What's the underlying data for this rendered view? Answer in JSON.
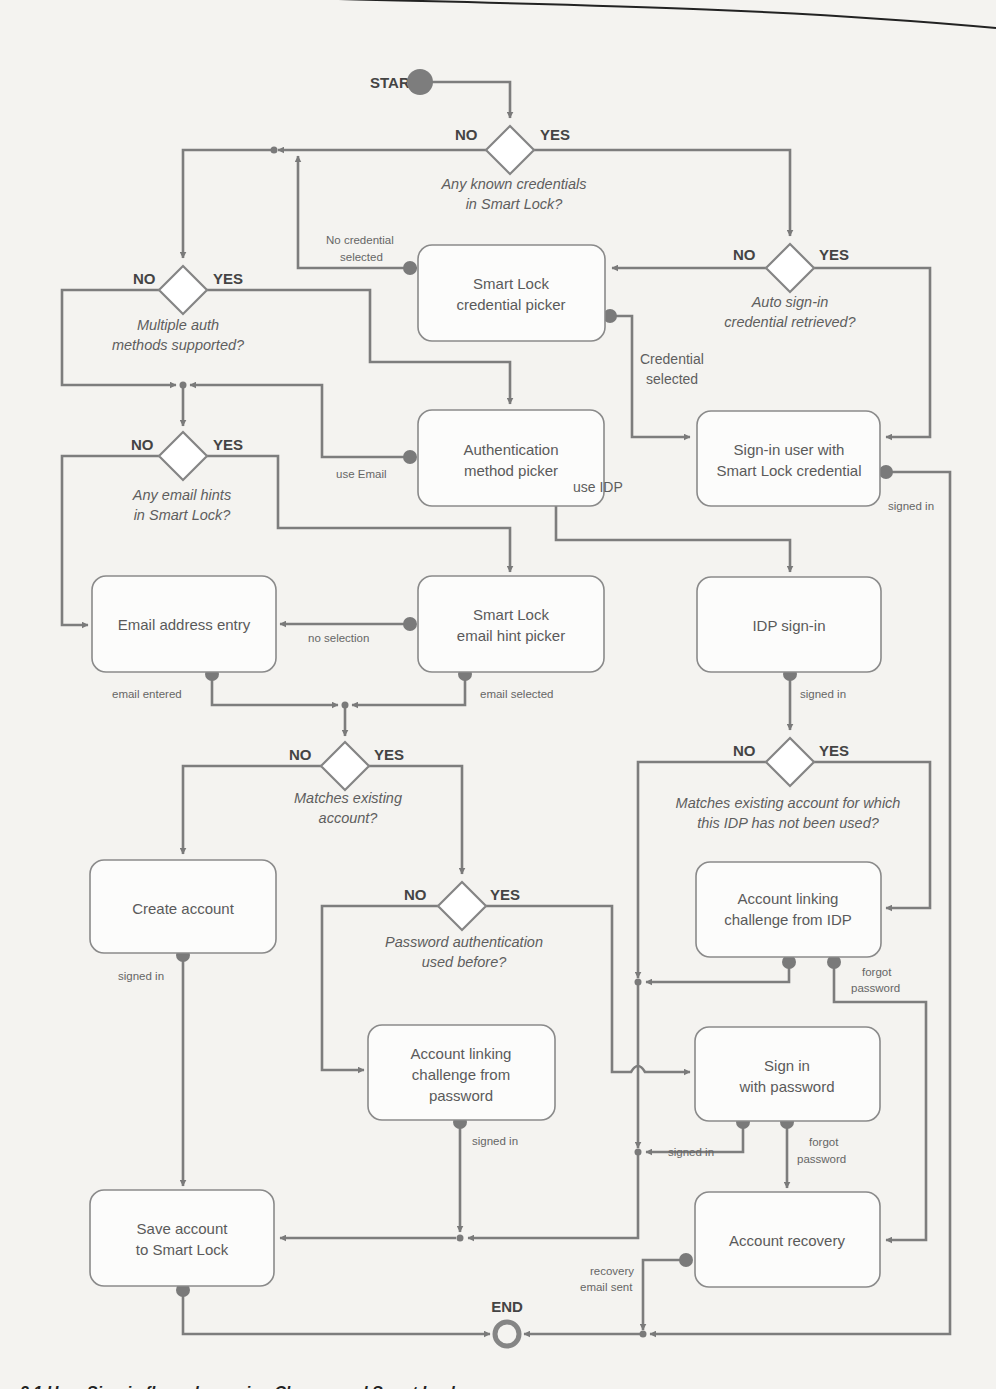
{
  "diagram": {
    "type": "flowchart",
    "terminals": {
      "start": {
        "label": "START"
      },
      "end": {
        "label": "END"
      }
    },
    "decisions": [
      {
        "id": "known_credentials",
        "question_line1": "Any known credentials",
        "question_line2": "in Smart Lock?",
        "no": "NO",
        "yes": "YES"
      },
      {
        "id": "auto_signin",
        "question_line1": "Auto sign-in",
        "question_line2": "credential retrieved?",
        "no": "NO",
        "yes": "YES"
      },
      {
        "id": "multiple_auth",
        "question_line1": "Multiple auth",
        "question_line2": "methods supported?",
        "no": "NO",
        "yes": "YES"
      },
      {
        "id": "email_hints",
        "question_line1": "Any email hints",
        "question_line2": "in Smart Lock?",
        "no": "NO",
        "yes": "YES"
      },
      {
        "id": "matches_account",
        "question_line1": "Matches existing",
        "question_line2": "account?",
        "no": "NO",
        "yes": "YES"
      },
      {
        "id": "idp_match",
        "question_line1": "Matches existing account for which",
        "question_line2": "this IDP has not been used?",
        "no": "NO",
        "yes": "YES"
      },
      {
        "id": "password_used",
        "question_line1": "Password authentication",
        "question_line2": "used before?",
        "no": "NO",
        "yes": "YES"
      }
    ],
    "nodes": [
      {
        "id": "credential_picker",
        "line1": "Smart Lock",
        "line2": "credential picker"
      },
      {
        "id": "signin_smartlock",
        "line1": "Sign-in user with",
        "line2": "Smart Lock credential"
      },
      {
        "id": "auth_method_picker",
        "line1": "Authentication",
        "line2": "method picker"
      },
      {
        "id": "email_entry",
        "line1": "Email address entry"
      },
      {
        "id": "email_hint_picker",
        "line1": "Smart Lock",
        "line2": "email hint picker"
      },
      {
        "id": "idp_signin",
        "line1": "IDP sign-in"
      },
      {
        "id": "create_account",
        "line1": "Create account"
      },
      {
        "id": "linking_idp",
        "line1": "Account linking",
        "line2": "challenge from IDP"
      },
      {
        "id": "linking_password",
        "line1": "Account linking",
        "line2": "challenge from",
        "line3": "password"
      },
      {
        "id": "signin_password",
        "line1": "Sign in",
        "line2": "with password"
      },
      {
        "id": "save_account",
        "line1": "Save account",
        "line2": "to Smart Lock"
      },
      {
        "id": "account_recovery",
        "line1": "Account recovery"
      }
    ],
    "edge_labels": {
      "no_credential_1": "No credential",
      "no_credential_2": "selected",
      "credential_selected_1": "Credential",
      "credential_selected_2": "selected",
      "use_email": "use Email",
      "use_idp": "use IDP",
      "no_selection": "no selection",
      "email_entered": "email entered",
      "email_selected": "email selected",
      "signed_in_smartlock": "signed in",
      "signed_in_idp": "signed in",
      "signed_in_create": "signed in",
      "signed_in_linking_pw": "signed in",
      "signed_in_password": "signed in",
      "forgot_password_idp_1": "forgot",
      "forgot_password_idp_2": "password",
      "forgot_password_pw_1": "forgot",
      "forgot_password_pw_2": "password",
      "recovery_email_1": "recovery",
      "recovery_email_2": "email sent"
    }
  },
  "caption": "2.1  User Sign-in flow when using Chrome and Smart Lock"
}
